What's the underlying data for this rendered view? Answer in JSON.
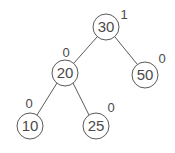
{
  "diagram": {
    "type": "binary-search-tree",
    "nodes": [
      {
        "id": "n30",
        "key": "30",
        "balance": "1",
        "cx": 106,
        "cy": 27,
        "label_x": 124,
        "label_y": 19
      },
      {
        "id": "n20",
        "key": "20",
        "balance": "0",
        "cx": 65,
        "cy": 73,
        "label_x": 66,
        "label_y": 57
      },
      {
        "id": "n50",
        "key": "50",
        "balance": "0",
        "cx": 145,
        "cy": 75,
        "label_x": 162,
        "label_y": 63
      },
      {
        "id": "n10",
        "key": "10",
        "balance": "0",
        "cx": 30,
        "cy": 126,
        "label_x": 29,
        "label_y": 108
      },
      {
        "id": "n25",
        "key": "25",
        "balance": "0",
        "cx": 96,
        "cy": 126,
        "label_x": 111,
        "label_y": 112
      }
    ],
    "edges": [
      {
        "from": "30",
        "to": "20"
      },
      {
        "from": "30",
        "to": "50"
      },
      {
        "from": "20",
        "to": "10"
      },
      {
        "from": "20",
        "to": "25"
      }
    ],
    "node_radius": 13,
    "stroke_color": "#5a5a5a",
    "text_color": "#4a4a4a"
  }
}
